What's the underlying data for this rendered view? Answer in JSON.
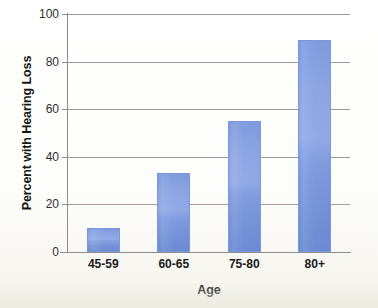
{
  "chart_data": {
    "type": "bar",
    "title": "",
    "xlabel": "Age",
    "ylabel": "Percent with Hearing Loss",
    "categories": [
      "45-59",
      "60-65",
      "75-80",
      "80+"
    ],
    "values": [
      10,
      33,
      55,
      89
    ],
    "ylim": [
      0,
      100
    ],
    "yticks": [
      0,
      20,
      40,
      60,
      80,
      100
    ],
    "ytick_labels": [
      "0",
      "20",
      "40",
      "60",
      "80",
      "100"
    ],
    "grid": "horizontal",
    "legend": "none",
    "bar_color": "#7f9ade",
    "bar_edge_color": "#7b98dc",
    "axis_color": "#8d8d8d",
    "gridline_color": "#9a9a9a",
    "background_color": "#fdfdfa"
  }
}
